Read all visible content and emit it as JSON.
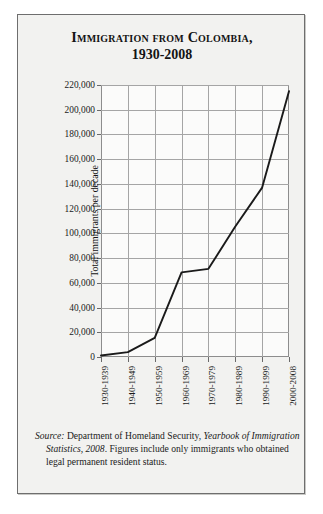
{
  "figure": {
    "title_line1": "Immigration from Colombia,",
    "title_line2": "1930-2008",
    "source_label": "Source:",
    "source_text_1": " Department of Homeland Security, ",
    "source_italic": "Yearbook of Immigration Statistics, 2008",
    "source_text_2": ". Figures include only immigrants who obtained legal permanent resident status."
  },
  "chart_data": {
    "type": "line",
    "title": "Immigration from Colombia, 1930-2008",
    "xlabel": "",
    "ylabel": "Total immigrants per decade",
    "categories": [
      "1930-1939",
      "1940-1949",
      "1950-1959",
      "1960-1969",
      "1970-1979",
      "1980-1989",
      "1990-1999",
      "2000-2008"
    ],
    "values": [
      1200,
      3900,
      15500,
      68400,
      71300,
      105500,
      137000,
      215000
    ],
    "ylim": [
      0,
      220000
    ],
    "ytick_step": 20000,
    "yticks": [
      "0",
      "20,000",
      "40,000",
      "60,000",
      "80,000",
      "100,000",
      "120,000",
      "140,000",
      "160,000",
      "180,000",
      "200,000",
      "220,000"
    ],
    "grid": true,
    "legend": false,
    "line_color": "#1a1a1a",
    "grid_color": "#a5a5a5"
  }
}
